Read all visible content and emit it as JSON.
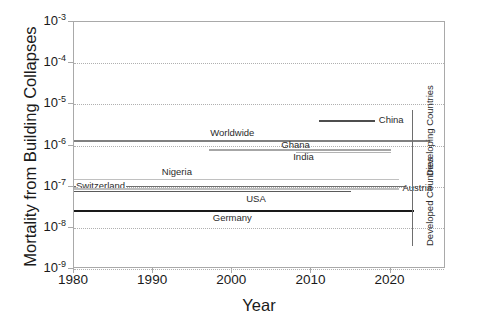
{
  "chart_data": {
    "type": "line",
    "title": "",
    "xlabel": "Year",
    "ylabel": "Mortality from Building Collapses",
    "xlim": [
      1980,
      2027
    ],
    "ylim": [
      1e-09,
      0.001
    ],
    "yscale": "log",
    "grid": true,
    "legend_position": "inline-labels",
    "xticks": [
      "1980",
      "1990",
      "2000",
      "2010",
      "2020"
    ],
    "xtick_values": [
      1980,
      1990,
      2000,
      2010,
      2020
    ],
    "yticks": [
      "10-3",
      "10-4",
      "10-5",
      "10-6",
      "10-7",
      "10-8",
      "10-9"
    ],
    "ytick_values": [
      0.001,
      0.0001,
      1e-05,
      1e-06,
      1e-07,
      1e-08,
      1e-09
    ],
    "series": [
      {
        "name": "Worldwide",
        "label": "Worldwide",
        "value": 1.35e-06,
        "x_start": 1980,
        "x_end": 2025,
        "color": "#808080",
        "width": 2.0,
        "label_x": 2000,
        "label_anchor": "above"
      },
      {
        "name": "China",
        "label": "China",
        "value": 4.2e-06,
        "x_start": 2011,
        "x_end": 2018,
        "color": "#4d4d4d",
        "width": 2.0,
        "label_x": 2019,
        "label_anchor": "right"
      },
      {
        "name": "India",
        "label": "India",
        "value": 8e-07,
        "x_start": 1997,
        "x_end": 2020,
        "color": "#a6a6a6",
        "width": 2.0,
        "label_x": 2009,
        "label_anchor": "below"
      },
      {
        "name": "Ghana",
        "label": "Ghana",
        "value": 6.8e-07,
        "x_start": 2008,
        "x_end": 2020,
        "color": "#b3b3b3",
        "width": 1.6,
        "label_x": 2008,
        "label_anchor": "above"
      },
      {
        "name": "Nigeria",
        "label": "Nigeria",
        "value": 1.5e-07,
        "x_start": 1980,
        "x_end": 2021,
        "color": "#c0c0c0",
        "width": 1.6,
        "label_x": 1993,
        "label_anchor": "above"
      },
      {
        "name": "Switzerland",
        "label": "Switzerland",
        "value": 1.02e-07,
        "x_start": 1980,
        "x_end": 2022,
        "color": "#707070",
        "width": 1.6,
        "label_x": 1980,
        "label_anchor": "left"
      },
      {
        "name": "Austria",
        "label": "Austria",
        "value": 9.3e-08,
        "x_start": 1980,
        "x_end": 2021,
        "color": "#bdbdbd",
        "width": 2.4,
        "label_x": 2021,
        "label_anchor": "right"
      },
      {
        "name": "USA",
        "label": "USA",
        "value": 8e-08,
        "x_start": 1980,
        "x_end": 2015,
        "color": "#5a5a5a",
        "width": 1.8,
        "label_x": 2003,
        "label_anchor": "below"
      },
      {
        "name": "Germany",
        "label": "Germany",
        "value": 2.7e-08,
        "x_start": 1980,
        "x_end": 2023,
        "color": "#1a1a1a",
        "width": 2.4,
        "label_x": 2000,
        "label_anchor": "below"
      }
    ],
    "brackets": [
      {
        "name": "developing",
        "label": "Developing Countries",
        "y_top": 110,
        "y_bottom": 176
      },
      {
        "name": "developed",
        "label": "Developed Countries",
        "y_top": 176,
        "y_bottom": 246
      }
    ]
  }
}
